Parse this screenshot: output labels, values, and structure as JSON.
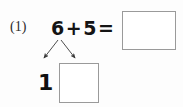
{
  "worksheet": {
    "problem_number": "(1)",
    "equation": {
      "addend_1": "6",
      "plus_sign": "+",
      "addend_2": "5",
      "equals_sign": "="
    },
    "answer_box": {
      "value": "",
      "placeholder": ""
    },
    "decomposition": {
      "left_part": "1",
      "right_part_box": {
        "value": "",
        "placeholder": ""
      },
      "left_arrow": "arrow-down-left",
      "right_arrow": "arrow-down-right"
    },
    "colors": {
      "page_background": "#fdfdfd",
      "text": "#141414",
      "box_border": "#9a9a9a",
      "arrow": "#3a3a3a"
    }
  }
}
